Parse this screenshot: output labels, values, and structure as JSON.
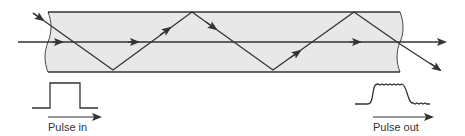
{
  "colors": {
    "fiber_fill": "#e8e8e8",
    "stroke": "#333333",
    "background": "#ffffff"
  },
  "fiber": {
    "left_x": 48,
    "right_x": 400,
    "top_y": 12,
    "bottom_y": 72,
    "axis_y": 42
  },
  "rays": [
    {
      "name": "axial-ray",
      "points": [
        [
          18,
          42
        ],
        [
          445,
          42
        ]
      ],
      "arrows_at_x": [
        62,
        138,
        360,
        440
      ]
    },
    {
      "name": "zigzag-ray",
      "points": [
        [
          33,
          13
        ],
        [
          113,
          70
        ],
        [
          192,
          12
        ],
        [
          273,
          70
        ],
        [
          354,
          12
        ],
        [
          400,
          44
        ],
        [
          440,
          70
        ]
      ]
    }
  ],
  "labels": {
    "pulse_in": "Pulse in",
    "pulse_out": "Pulse out"
  },
  "pulses": {
    "input": {
      "shape": "rectangular",
      "baseline_y": 108,
      "top_y": 83,
      "x_start": 32,
      "rise_x": 50,
      "fall_x": 80,
      "x_end": 98
    },
    "output": {
      "shape": "broadened-noisy",
      "baseline_y": 104,
      "top_y": 84,
      "x_start": 355,
      "x_end": 430
    }
  }
}
